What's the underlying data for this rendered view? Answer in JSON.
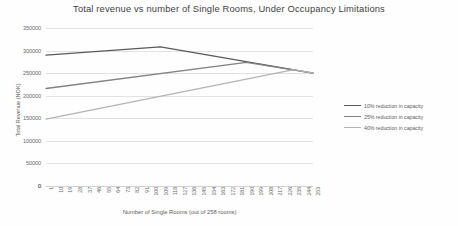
{
  "chart_data": {
    "type": "line",
    "title": "Total revenue vs number of Single Rooms, Under Occupancy Limitations",
    "xlabel": "Number of Single Rooms (out of 258 rooms)",
    "ylabel": "Total Revenue (NOK)",
    "ylim": [
      0,
      350000
    ],
    "xlim": [
      1,
      253
    ],
    "grid": true,
    "legend_position": "right",
    "y_ticks": [
      0,
      50000,
      100000,
      150000,
      200000,
      250000,
      300000,
      350000
    ],
    "y_tick_labels": [
      "0",
      "50000",
      "100000",
      "150000",
      "200000",
      "250000",
      "300000",
      "350000"
    ],
    "x_ticks": [
      1,
      10,
      19,
      28,
      37,
      46,
      55,
      64,
      73,
      82,
      91,
      100,
      109,
      118,
      127,
      136,
      145,
      154,
      163,
      172,
      181,
      190,
      199,
      208,
      217,
      226,
      235,
      244,
      253
    ],
    "x_tick_labels": [
      "1",
      "10",
      "19",
      "28",
      "37",
      "46",
      "55",
      "64",
      "73",
      "82",
      "91",
      "100",
      "109",
      "118",
      "127",
      "136",
      "145",
      "154",
      "163",
      "172",
      "181",
      "190",
      "199",
      "208",
      "217",
      "226",
      "235",
      "244",
      "253"
    ],
    "series": [
      {
        "name": "10% reduction in capacity",
        "color": "#5a5a5a",
        "x": [
          1,
          109,
          253
        ],
        "values": [
          290000,
          308000,
          250000
        ]
      },
      {
        "name": "25% reduction in capacity",
        "color": "#828282",
        "x": [
          1,
          190,
          253
        ],
        "values": [
          216000,
          274000,
          250000
        ]
      },
      {
        "name": "40% reduction in capacity",
        "color": "#b4b4b4",
        "x": [
          1,
          235,
          253
        ],
        "values": [
          148000,
          258000,
          250000
        ]
      }
    ]
  },
  "legend": {
    "items": [
      {
        "label": "10% reduction in capacity",
        "color": "#5a5a5a"
      },
      {
        "label": "25% reduction in capacity",
        "color": "#828282"
      },
      {
        "label": "40% reduction in capacity",
        "color": "#b4b4b4"
      }
    ]
  },
  "axis": {
    "x_zero_origin_label": "0"
  }
}
